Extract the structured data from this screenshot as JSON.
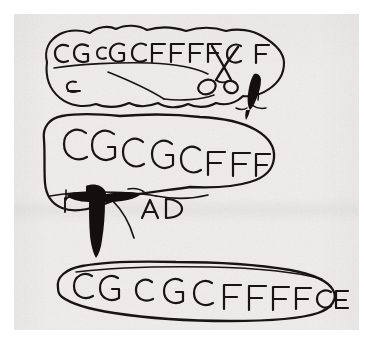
{
  "image": {
    "medium": "ink drawing on paper (scanned)",
    "paper_color": "#f0eeec",
    "ink_color": "#171412",
    "border_color": "#ffffff"
  },
  "shapes": [
    {
      "name": "top-bubble",
      "type": "irregular enclosed outline",
      "text_line": "CG CG CFFFFC F",
      "segments": [
        "CG",
        "CG",
        "CFFFF",
        "C",
        "F"
      ],
      "sub_text": "c",
      "drawings": [
        "scissors-icon",
        "quill-icon"
      ]
    },
    {
      "name": "middle-bubble",
      "type": "irregular enclosed outline",
      "text_line": "CGCGCFFF",
      "segments": [
        "CGCGC",
        "F",
        "F",
        "F"
      ],
      "sub_text": "r",
      "inner_text": "A D",
      "drawings": [
        "cross-sword-icon"
      ]
    },
    {
      "name": "bottom-bubble",
      "type": "elongated enclosed outline",
      "text_line": "CG CGC FFFFCE",
      "segments": [
        "CG",
        "CGC",
        "FFFF",
        "CE"
      ],
      "drawings": []
    }
  ],
  "labels": {
    "top_line": "CG CG CFFFFC F",
    "top_small": "c",
    "middle_line": "CGCGCFFF",
    "middle_small": "r",
    "middle_inner": "A D",
    "bottom_line": "CG CGC FFFFCE"
  },
  "icons": {
    "scissors": "scissors-icon",
    "quill": "quill-icon",
    "cross_sword": "cross-sword-icon"
  }
}
